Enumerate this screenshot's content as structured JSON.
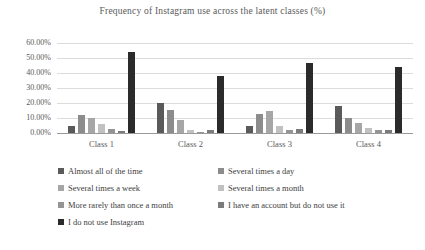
{
  "title": "Frequency of Instagram use across the latent classes (%)",
  "chart_data": {
    "type": "bar",
    "title": "Frequency of Instagram use across the latent classes (%)",
    "categories": [
      "Class 1",
      "Class 2",
      "Class 3",
      "Class 4"
    ],
    "series": [
      {
        "name": "Almost all of the time",
        "color": "#5a5a5a",
        "values": [
          5,
          20,
          5,
          18
        ]
      },
      {
        "name": "Several times a day",
        "color": "#8c8c8c",
        "values": [
          12,
          15.5,
          13,
          10
        ]
      },
      {
        "name": "Several times a week",
        "color": "#a6a6a6",
        "values": [
          10,
          9,
          15,
          7
        ]
      },
      {
        "name": "Several times a month",
        "color": "#c1c1c1",
        "values": [
          6,
          2,
          4.5,
          3.5
        ]
      },
      {
        "name": "More rarely than once a month",
        "color": "#949494",
        "values": [
          2.5,
          1,
          2,
          2
        ]
      },
      {
        "name": "I have an account but do not use it",
        "color": "#7b7b7b",
        "values": [
          1.5,
          2,
          3,
          2
        ]
      },
      {
        "name": "I do not use Instagram",
        "color": "#2b2b2b",
        "values": [
          54,
          38,
          47,
          44
        ]
      }
    ],
    "xlabel": "",
    "ylabel": "",
    "ylim": [
      0,
      60
    ],
    "ytick_step": 10,
    "ytick_labels": [
      "0.00%",
      "10.00%",
      "20.00%",
      "30.00%",
      "40.00%",
      "50.00%",
      "60.00%"
    ],
    "grid": true,
    "legend_position": "bottom-left-two-columns",
    "colors": {
      "grid": "#dcdcdc",
      "axis_line": "#9a9a9a",
      "title_text": "#595959",
      "tick_text": "#595959",
      "legend_text": "#404040",
      "background": "#ffffff"
    }
  }
}
